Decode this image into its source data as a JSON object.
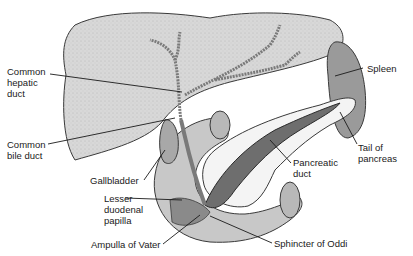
{
  "diagram": {
    "colors": {
      "liver": "#d6d6d6",
      "liver_edge": "#3a3a3a",
      "spleen": "#9a9a9a",
      "gallbladder": "#a8a8a8",
      "duodenum": "#c8c8c8",
      "pancreas": "#f4f4f4",
      "pancreatic_duct": "#6e6e6e",
      "background": "#ffffff"
    },
    "labels": [
      {
        "id": "common-hepatic-duct",
        "text": "Common\nhepatic\nduct"
      },
      {
        "id": "common-bile-duct",
        "text": "Common\nbile duct"
      },
      {
        "id": "gallbladder",
        "text": "Gallbladder"
      },
      {
        "id": "lesser-duodenal-papilla",
        "text": "Lesser\nduodenal\npapilla"
      },
      {
        "id": "ampulla-of-vater",
        "text": "Ampulla of Vater"
      },
      {
        "id": "spleen",
        "text": "Spleen"
      },
      {
        "id": "tail-of-pancreas",
        "text": "Tail of\npancreas"
      },
      {
        "id": "pancreatic-duct",
        "text": "Pancreatic\nduct"
      },
      {
        "id": "sphincter-of-oddi",
        "text": "Sphincter of Oddi"
      }
    ]
  }
}
